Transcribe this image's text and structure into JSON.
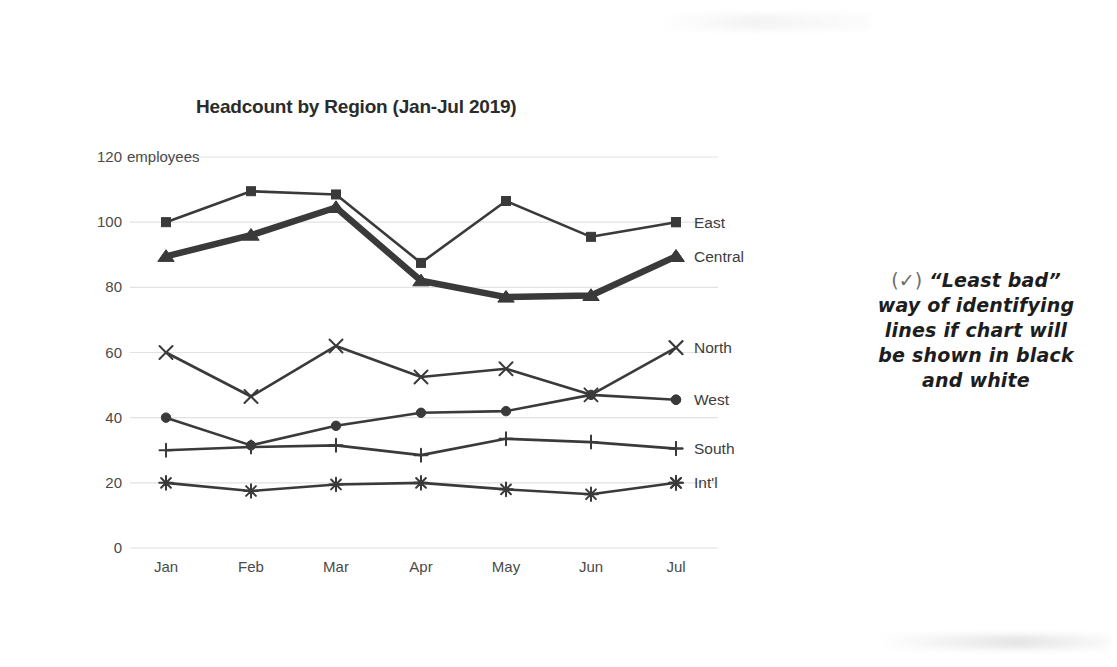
{
  "chart_data": {
    "type": "line",
    "title": "Headcount by Region (Jan-Jul 2019)",
    "xlabel": "",
    "ylabel": "120 employees",
    "y_unit_text": "employees",
    "categories": [
      "Jan",
      "Feb",
      "Mar",
      "Apr",
      "May",
      "Jun",
      "Jul"
    ],
    "ylim": [
      0,
      120
    ],
    "yticks": [
      0,
      20,
      40,
      60,
      80,
      100,
      120
    ],
    "ytick_labels": [
      "0",
      "20",
      "40",
      "60",
      "80",
      "100",
      "120 employees"
    ],
    "grid": true,
    "legend_position": "right-inline",
    "series": [
      {
        "name": "East",
        "marker": "square",
        "emphasis": false,
        "values": [
          100,
          109.5,
          108.5,
          87.5,
          106.5,
          95.5,
          100
        ]
      },
      {
        "name": "Central",
        "marker": "triangle",
        "emphasis": true,
        "values": [
          89.5,
          96,
          104.5,
          82,
          77,
          77.5,
          89.5
        ]
      },
      {
        "name": "North",
        "marker": "cross",
        "emphasis": false,
        "values": [
          60,
          46.5,
          62,
          52.5,
          55,
          47,
          61.5
        ]
      },
      {
        "name": "West",
        "marker": "circle",
        "emphasis": false,
        "values": [
          40,
          31.5,
          37.5,
          41.5,
          42,
          47,
          45.5
        ]
      },
      {
        "name": "South",
        "marker": "plus",
        "emphasis": false,
        "values": [
          30,
          31,
          31.5,
          28.5,
          33.5,
          32.5,
          30.5
        ]
      },
      {
        "name": "Int'l",
        "marker": "star",
        "emphasis": false,
        "values": [
          20,
          17.5,
          19.5,
          20,
          18,
          16.5,
          20
        ]
      }
    ],
    "colors": {
      "line": "#3a3a3a",
      "emphasis_line": "#3a3a3a",
      "grid": "#e2e2e2",
      "text": "#4a4a4a",
      "title": "#2b2b2b"
    }
  },
  "annotation": {
    "check_symbol": "(✓)",
    "line1": "“Least bad”",
    "line2": "way of identifying",
    "line3": "lines if chart will",
    "line4": "be shown in black",
    "line5": "and white",
    "full_text": "(✓) “Least bad” way of identifying lines if chart will be shown in black and white"
  }
}
